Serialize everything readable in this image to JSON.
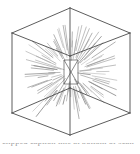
{
  "figure": {
    "kind": "line-drawing",
    "background_color": "#ffffff",
    "edge_color": "#4a4a4a",
    "ray_color": "#9a9a9a",
    "caption_partial": "clipped caption line at bottom of scan",
    "caption_color": "#9a9a9a"
  },
  "geometry": {
    "outer_cube": {
      "description": "Cube drawn in two-point perspective, front vertical edge facing viewer",
      "vertices": {
        "top_apex": [
          70,
          8
        ],
        "left_top": [
          12,
          33
        ],
        "right_top": [
          130,
          33
        ],
        "left_bottom": [
          12,
          113
        ],
        "right_bottom": [
          130,
          113
        ],
        "bottom_apex": [
          70,
          135
        ],
        "front_top": [
          70,
          56
        ],
        "front_bottom": [
          70,
          88
        ]
      },
      "edges": [
        [
          70,
          8,
          12,
          33
        ],
        [
          70,
          8,
          130,
          33
        ],
        [
          12,
          33,
          12,
          113
        ],
        [
          130,
          33,
          130,
          113
        ],
        [
          12,
          113,
          70,
          135
        ],
        [
          130,
          113,
          70,
          135
        ],
        [
          70,
          8,
          70,
          56
        ],
        [
          12,
          33,
          70,
          56
        ],
        [
          130,
          33,
          70,
          56
        ],
        [
          70,
          88,
          70,
          135
        ],
        [
          12,
          113,
          70,
          88
        ],
        [
          130,
          113,
          70,
          88
        ],
        [
          70,
          56,
          70,
          88
        ]
      ]
    },
    "inner_square": {
      "description": "Small inner vanishing rectangle at the centre of the cube",
      "vertices": [
        [
          64,
          60
        ],
        [
          78,
          60
        ],
        [
          78,
          84
        ],
        [
          64,
          84
        ]
      ],
      "diagonals": [
        [
          64,
          60,
          78,
          84
        ],
        [
          78,
          60,
          64,
          84
        ]
      ]
    },
    "rays": {
      "description": "Short dashed line segments radiating outward from the centre of the cube toward every face and corner",
      "origin": [
        71,
        72
      ],
      "count": 96,
      "inner_radius_min": 7,
      "inner_radius_max": 26,
      "outer_radius_min": 26,
      "outer_radius_max": 62,
      "stroke_width": 0.6
    }
  }
}
